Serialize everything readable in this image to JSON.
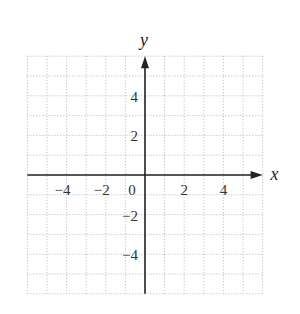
{
  "chart_data": {
    "type": "scatter",
    "title": "",
    "xlabel": "x",
    "ylabel": "y",
    "xlim": [
      -6,
      6
    ],
    "ylim": [
      -6,
      6
    ],
    "grid": true,
    "grid_style": "dotted",
    "x_ticks": [
      -4,
      -2,
      0,
      2,
      4
    ],
    "y_ticks": [
      4,
      2,
      -2,
      -4
    ],
    "x_tick_labels": [
      "−4",
      "−2",
      "0",
      "2",
      "4"
    ],
    "y_tick_labels": [
      "4",
      "2",
      "−2",
      "−4"
    ],
    "series": []
  },
  "colors": {
    "axis": "#222222",
    "grid": "#b5b5b5",
    "text": "#333333",
    "background": "#ffffff"
  }
}
